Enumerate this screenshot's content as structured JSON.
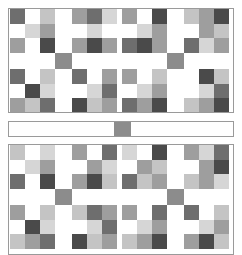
{
  "figure": {
    "background_color": "#ffffff",
    "outline_color": "#9a9a9a"
  },
  "palette": {
    "white": "#ffffff",
    "light": "#c4c4c4",
    "lighter": "#d6d6d6",
    "medium": "#9e9e9e",
    "medium_dark": "#8a8a8a",
    "dark": "#6e6e6e",
    "darkest": "#4a4a4a",
    "sash_square": "#8c8c8c"
  },
  "sash_bar": {
    "name": "middle-sashing-strip",
    "center_square_color": "#8c8c8c"
  },
  "panels": [
    {
      "name": "top-panel",
      "quadrants": [
        {
          "name": "quadrant-top-left",
          "blocks": [
            {
              "name": "block-tl",
              "cells": [
                "d",
                "w",
                "l",
                "w",
                "ll",
                "m",
                "m",
                "w",
                "dd"
              ]
            },
            {
              "name": "block-tr",
              "cells": [
                "m",
                "d",
                "ll",
                "w",
                "ll",
                "w",
                "m",
                "dd",
                "m"
              ]
            },
            {
              "name": "block-bl",
              "cells": [
                "d",
                "w",
                "l",
                "w",
                "dd",
                "ll",
                "m",
                "l",
                "d"
              ]
            },
            {
              "name": "block-br",
              "cells": [
                "d",
                "w",
                "m",
                "w",
                "ll",
                "d",
                "dd",
                "l",
                "m"
              ]
            }
          ]
        },
        {
          "name": "quadrant-top-right",
          "blocks": [
            {
              "name": "block-tl",
              "cells": [
                "m",
                "w",
                "dd",
                "w",
                "ll",
                "m",
                "d",
                "dd",
                "m"
              ]
            },
            {
              "name": "block-tr",
              "cells": [
                "l",
                "m",
                "dd",
                "w",
                "m",
                "l",
                "d",
                "ll",
                "m"
              ]
            },
            {
              "name": "block-bl",
              "cells": [
                "m",
                "w",
                "l",
                "w",
                "ll",
                "m",
                "d",
                "m",
                "dd"
              ]
            },
            {
              "name": "block-br",
              "cells": [
                "w",
                "dd",
                "l",
                "w",
                "ll",
                "d",
                "l",
                "m",
                "dd"
              ]
            }
          ]
        },
        {
          "name": "quadrant-bottom-left",
          "blocks": [
            {
              "name": "block-tl",
              "cells": [
                "d",
                "w",
                "l",
                "w",
                "ll",
                "m",
                "m",
                "w",
                "dd"
              ]
            },
            {
              "name": "block-tr",
              "cells": [
                "m",
                "d",
                "ll",
                "w",
                "ll",
                "w",
                "m",
                "dd",
                "m"
              ]
            },
            {
              "name": "block-bl",
              "cells": [
                "d",
                "w",
                "l",
                "w",
                "dd",
                "ll",
                "m",
                "l",
                "d"
              ]
            },
            {
              "name": "block-br",
              "cells": [
                "d",
                "w",
                "m",
                "w",
                "ll",
                "d",
                "dd",
                "l",
                "m"
              ]
            }
          ]
        },
        {
          "name": "quadrant-bottom-right",
          "blocks": [
            {
              "name": "block-tl",
              "cells": [
                "m",
                "w",
                "dd",
                "w",
                "ll",
                "m",
                "d",
                "dd",
                "m"
              ]
            },
            {
              "name": "block-tr",
              "cells": [
                "l",
                "m",
                "dd",
                "w",
                "m",
                "l",
                "d",
                "ll",
                "m"
              ]
            },
            {
              "name": "block-bl",
              "cells": [
                "m",
                "w",
                "l",
                "w",
                "ll",
                "m",
                "d",
                "m",
                "dd"
              ]
            },
            {
              "name": "block-br",
              "cells": [
                "w",
                "dd",
                "l",
                "w",
                "ll",
                "d",
                "l",
                "m",
                "dd"
              ]
            }
          ]
        }
      ]
    },
    {
      "name": "bottom-panel",
      "quadrants": [
        {
          "name": "quadrant-top-left",
          "blocks": [
            {
              "name": "block-tl",
              "cells": [
                "l",
                "w",
                "ll",
                "w",
                "ll",
                "m",
                "d",
                "w",
                "dd"
              ]
            },
            {
              "name": "block-tr",
              "cells": [
                "m",
                "w",
                "d",
                "w",
                "m",
                "ll",
                "m",
                "dd",
                "l"
              ]
            },
            {
              "name": "block-bl",
              "cells": [
                "m",
                "w",
                "l",
                "w",
                "dd",
                "ll",
                "l",
                "m",
                "d"
              ]
            },
            {
              "name": "block-br",
              "cells": [
                "l",
                "d",
                "m",
                "w",
                "ll",
                "d",
                "dd",
                "l",
                "m"
              ]
            }
          ]
        },
        {
          "name": "quadrant-top-right",
          "blocks": [
            {
              "name": "block-tl",
              "cells": [
                "ll",
                "w",
                "dd",
                "w",
                "m",
                "l",
                "d",
                "l",
                "m"
              ]
            },
            {
              "name": "block-tr",
              "cells": [
                "m",
                "ll",
                "d",
                "w",
                "m",
                "dd",
                "l",
                "m",
                "ll"
              ]
            },
            {
              "name": "block-bl",
              "cells": [
                "m",
                "w",
                "d",
                "w",
                "ll",
                "m",
                "l",
                "m",
                "dd"
              ]
            },
            {
              "name": "block-br",
              "cells": [
                "d",
                "w",
                "l",
                "w",
                "ll",
                "m",
                "m",
                "dd",
                "l"
              ]
            }
          ]
        },
        {
          "name": "quadrant-bottom-left",
          "blocks": [
            {
              "name": "block-tl",
              "cells": [
                "l",
                "w",
                "ll",
                "w",
                "ll",
                "m",
                "d",
                "w",
                "dd"
              ]
            },
            {
              "name": "block-tr",
              "cells": [
                "m",
                "w",
                "d",
                "w",
                "m",
                "ll",
                "m",
                "dd",
                "l"
              ]
            },
            {
              "name": "block-bl",
              "cells": [
                "m",
                "w",
                "l",
                "w",
                "dd",
                "ll",
                "l",
                "m",
                "d"
              ]
            },
            {
              "name": "block-br",
              "cells": [
                "l",
                "d",
                "m",
                "w",
                "ll",
                "d",
                "dd",
                "l",
                "m"
              ]
            }
          ]
        },
        {
          "name": "quadrant-bottom-right",
          "blocks": [
            {
              "name": "block-tl",
              "cells": [
                "ll",
                "w",
                "dd",
                "w",
                "m",
                "l",
                "d",
                "l",
                "m"
              ]
            },
            {
              "name": "block-tr",
              "cells": [
                "m",
                "ll",
                "d",
                "w",
                "m",
                "dd",
                "l",
                "m",
                "ll"
              ]
            },
            {
              "name": "block-bl",
              "cells": [
                "m",
                "w",
                "d",
                "w",
                "ll",
                "m",
                "l",
                "m",
                "dd"
              ]
            },
            {
              "name": "block-br",
              "cells": [
                "d",
                "w",
                "l",
                "w",
                "ll",
                "m",
                "m",
                "dd",
                "l"
              ]
            }
          ]
        }
      ]
    }
  ]
}
